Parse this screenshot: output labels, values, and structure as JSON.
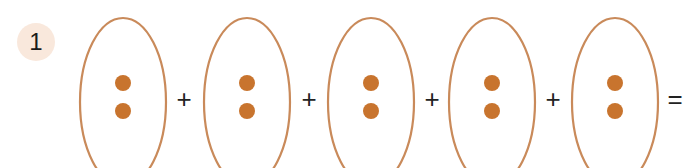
{
  "problem": {
    "number": "1",
    "groups": [
      {
        "dots": 2
      },
      {
        "dots": 2
      },
      {
        "dots": 2
      },
      {
        "dots": 2
      },
      {
        "dots": 2
      }
    ],
    "operators": [
      "+",
      "+",
      "+",
      "+",
      "="
    ]
  },
  "colors": {
    "outline": "#c98a5a",
    "dot": "#c8742e",
    "badge_bg": "#f9e8dc"
  }
}
